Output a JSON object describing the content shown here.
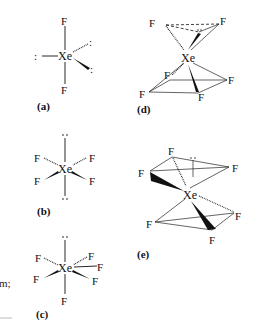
{
  "figure": {
    "structures": [
      {
        "id": "a",
        "label": "(a)",
        "center": "Xe",
        "ligands": [
          "F",
          "F"
        ],
        "lone_pairs": 3,
        "geometry": "linear (trigonal bipyramidal electron pair)"
      },
      {
        "id": "b",
        "label": "(b)",
        "center": "Xe",
        "ligands": [
          "F",
          "F",
          "F",
          "F"
        ],
        "lone_pairs": 2,
        "geometry": "square planar (octahedral electron pair)"
      },
      {
        "id": "c",
        "label": "(c)",
        "center": "Xe",
        "ligands": [
          "F",
          "F",
          "F",
          "F",
          "F",
          "F"
        ],
        "lone_pairs": 1,
        "geometry": "distorted octahedral"
      },
      {
        "id": "d",
        "label": "(d)",
        "center": "Xe",
        "ligands": [
          "F",
          "F",
          "F",
          "F",
          "F",
          "F"
        ],
        "lone_pairs": 1,
        "geometry": "capped / pyramidal arrangement"
      },
      {
        "id": "e",
        "label": "(e)",
        "center": "Xe",
        "ligands": [
          "F",
          "F",
          "F",
          "F",
          "F",
          "F"
        ],
        "lone_pairs": 1,
        "geometry": "capped arrangement"
      }
    ],
    "atoms": {
      "xe": "Xe",
      "f": "F",
      "lone_pair": ":",
      "lone_pair_v": "··"
    },
    "fragment_text": "m;"
  }
}
